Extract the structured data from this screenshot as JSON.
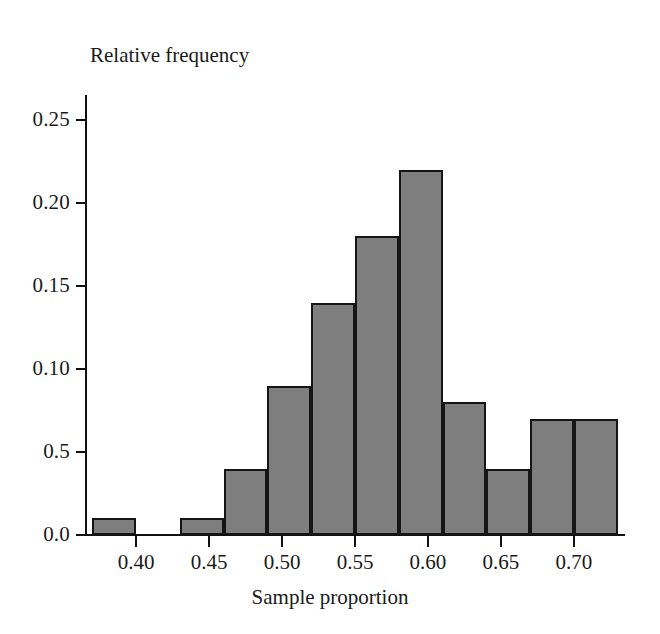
{
  "chart_data": {
    "type": "bar",
    "title": "",
    "subtitle": "",
    "xlabel": "Sample proportion",
    "ylabel": "Relative frequency",
    "xlim": [
      0.365,
      0.735
    ],
    "ylim": [
      0.0,
      0.265
    ],
    "grid": false,
    "legend": null,
    "bin_width": 0.03,
    "x_tick_labels": [
      "0.40",
      "0.45",
      "0.50",
      "0.55",
      "0.60",
      "0.65",
      "0.70"
    ],
    "x_tick_values": [
      0.4,
      0.45,
      0.5,
      0.55,
      0.6,
      0.65,
      0.7
    ],
    "y_tick_labels": [
      "0.0",
      "0.5",
      "0.10",
      "0.15",
      "0.20",
      "0.25"
    ],
    "y_tick_values": [
      0.0,
      0.05,
      0.1,
      0.15,
      0.2,
      0.25
    ],
    "bins": [
      {
        "left": 0.37,
        "right": 0.4,
        "value": 0.01
      },
      {
        "left": 0.4,
        "right": 0.43,
        "value": 0.0
      },
      {
        "left": 0.43,
        "right": 0.46,
        "value": 0.01
      },
      {
        "left": 0.46,
        "right": 0.49,
        "value": 0.04
      },
      {
        "left": 0.49,
        "right": 0.52,
        "value": 0.09
      },
      {
        "left": 0.52,
        "right": 0.55,
        "value": 0.14
      },
      {
        "left": 0.55,
        "right": 0.58,
        "value": 0.18
      },
      {
        "left": 0.58,
        "right": 0.61,
        "value": 0.22
      },
      {
        "left": 0.61,
        "right": 0.64,
        "value": 0.08
      },
      {
        "left": 0.64,
        "right": 0.67,
        "value": 0.04
      },
      {
        "left": 0.67,
        "right": 0.7,
        "value": 0.07
      },
      {
        "left": 0.7,
        "right": 0.73,
        "value": 0.07
      }
    ],
    "categories": [
      "0.37-0.40",
      "0.40-0.43",
      "0.43-0.46",
      "0.46-0.49",
      "0.49-0.52",
      "0.52-0.55",
      "0.55-0.58",
      "0.58-0.61",
      "0.61-0.64",
      "0.64-0.67",
      "0.67-0.70",
      "0.70-0.73"
    ],
    "values": [
      0.01,
      0.0,
      0.01,
      0.04,
      0.09,
      0.14,
      0.18,
      0.22,
      0.08,
      0.04,
      0.07,
      0.07
    ],
    "colors": {
      "bar_fill": "#7e7e7e",
      "bar_stroke": "#151515",
      "axis": "#111111",
      "background": "#ffffff",
      "text": "#1a1a1a"
    }
  }
}
